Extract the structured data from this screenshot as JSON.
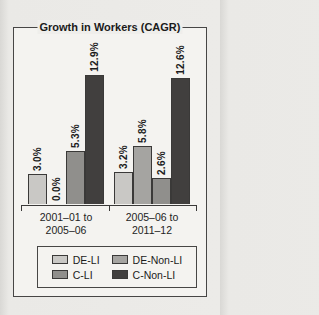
{
  "figure": {
    "kind": "scanned statistical figure",
    "border_color": "#474645",
    "background": "#f4f3f0"
  },
  "chart_data": {
    "type": "bar",
    "title": "Growth in Workers (CAGR)",
    "xlabel": "",
    "ylabel": "",
    "ylim": [
      0,
      14
    ],
    "grid": false,
    "legend_position": "bottom-box",
    "value_unit": "percent",
    "categories": [
      {
        "line1": "2001–01 to",
        "line2": "2005–06"
      },
      {
        "line1": "2005–06 to",
        "line2": "2011–12"
      }
    ],
    "series": [
      {
        "name": "DE-LI",
        "color": "#c9c8c5",
        "values": [
          3.0,
          3.2
        ],
        "labels": [
          "3.0%",
          "3.2%"
        ]
      },
      {
        "name": "DE-Non-LI",
        "color": "#a5a4a1",
        "values": [
          0.0,
          5.8
        ],
        "labels": [
          "0.0%",
          "5.8%"
        ]
      },
      {
        "name": "C-LI",
        "color": "#908f8c",
        "values": [
          5.3,
          2.6
        ],
        "labels": [
          "5.3%",
          "2.6%"
        ]
      },
      {
        "name": "C-Non-LI",
        "color": "#413f3e",
        "values": [
          12.9,
          12.6
        ],
        "labels": [
          "12.9%",
          "12.6%"
        ]
      }
    ]
  }
}
